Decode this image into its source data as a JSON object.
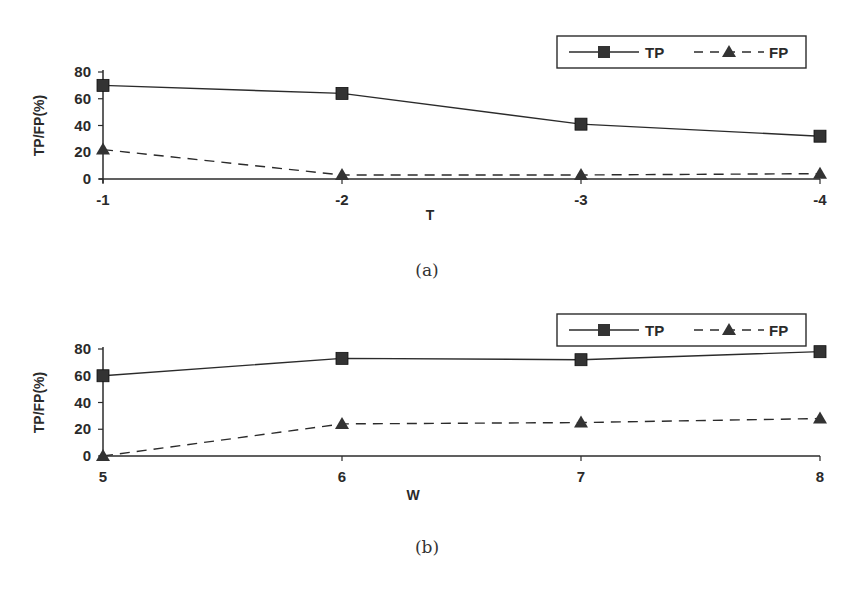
{
  "chart_data": [
    {
      "id": "a",
      "type": "line",
      "caption": "(a)",
      "xlabel": "T",
      "ylabel": "TP/FP(%)",
      "categories": [
        "-1",
        "-2",
        "-3",
        "-4"
      ],
      "yticks": [
        "0",
        "20",
        "40",
        "60",
        "80"
      ],
      "ylim": [
        0,
        80
      ],
      "grid": false,
      "legend_position": "top-right",
      "series": [
        {
          "name": "TP",
          "style": "solid",
          "marker": "square",
          "values": [
            70,
            64,
            41,
            32
          ]
        },
        {
          "name": "FP",
          "style": "dashed",
          "marker": "triangle",
          "values": [
            22,
            3,
            3,
            4
          ]
        }
      ]
    },
    {
      "id": "b",
      "type": "line",
      "caption": "(b)",
      "xlabel": "W",
      "ylabel": "TP/FP(%)",
      "categories": [
        "5",
        "6",
        "7",
        "8"
      ],
      "yticks": [
        "0",
        "20",
        "40",
        "60",
        "80"
      ],
      "ylim": [
        0,
        80
      ],
      "grid": false,
      "legend_position": "top-right",
      "series": [
        {
          "name": "TP",
          "style": "solid",
          "marker": "square",
          "values": [
            60,
            73,
            72,
            78
          ]
        },
        {
          "name": "FP",
          "style": "dashed",
          "marker": "triangle",
          "values": [
            0,
            24,
            25,
            28
          ]
        }
      ]
    }
  ],
  "colors": {
    "line": "#2b2b2b",
    "marker": "#333333",
    "background": "#ffffff"
  }
}
